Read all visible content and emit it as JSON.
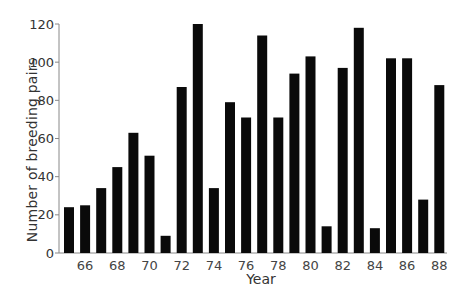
{
  "chart_data": {
    "type": "bar",
    "title": "",
    "xlabel": "Year",
    "ylabel": "Number of breeding pairs",
    "categories": [
      "65",
      "66",
      "67",
      "68",
      "69",
      "70",
      "71",
      "72",
      "73",
      "74",
      "75",
      "76",
      "77",
      "78",
      "79",
      "80",
      "81",
      "82",
      "83",
      "84",
      "85",
      "86",
      "87",
      "88"
    ],
    "values": [
      24,
      25,
      34,
      45,
      63,
      51,
      9,
      87,
      120,
      34,
      79,
      71,
      114,
      71,
      94,
      103,
      14,
      97,
      118,
      13,
      102,
      102,
      28,
      88
    ],
    "x_tick_labels": [
      "66",
      "68",
      "70",
      "72",
      "74",
      "76",
      "78",
      "80",
      "82",
      "84",
      "86",
      "88"
    ],
    "y_ticks": [
      0,
      20,
      40,
      60,
      80,
      100,
      120
    ],
    "ylim": [
      0,
      120
    ],
    "grid": false,
    "legend": null,
    "bar_color": "#0a0a0a"
  }
}
